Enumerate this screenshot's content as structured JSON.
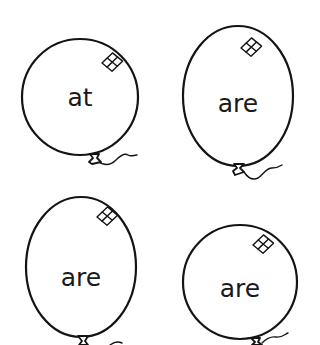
{
  "worksheet": {
    "balloons": [
      {
        "word": "at",
        "shape": "round"
      },
      {
        "word": "are",
        "shape": "oval"
      },
      {
        "word": "are",
        "shape": "oval"
      },
      {
        "word": "are",
        "shape": "round"
      }
    ]
  },
  "colors": {
    "outline": "#141414",
    "text": "#1a1a1a",
    "background": "#ffffff"
  }
}
